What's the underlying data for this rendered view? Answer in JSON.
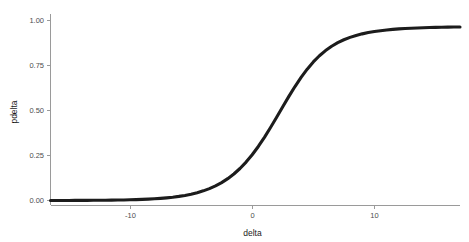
{
  "chart_data": {
    "type": "line",
    "title": "",
    "subtitle": "",
    "xlabel": "delta",
    "ylabel": "pdelta",
    "xlim": [
      -17.5,
      16.0
    ],
    "ylim": [
      -0.02,
      1.02
    ],
    "grid": false,
    "legend": null,
    "legend_position": "none",
    "annotations": [],
    "x_ticks": [
      -10,
      0,
      10
    ],
    "x_tick_labels": [
      "-10",
      "0",
      "10"
    ],
    "y_ticks": [
      0.0,
      0.25,
      0.5,
      0.75,
      1.0
    ],
    "y_tick_labels": [
      "0.00",
      "0.25",
      "0.50",
      "0.75",
      "1.00"
    ],
    "series": [
      {
        "name": "pdelta",
        "color": "#1c1c1c",
        "x": [
          -17.5,
          -17.0,
          -16.5,
          -16.0,
          -15.5,
          -15.0,
          -14.5,
          -14.0,
          -13.5,
          -13.0,
          -12.5,
          -12.0,
          -11.5,
          -11.0,
          -10.5,
          -10.0,
          -9.5,
          -9.0,
          -8.5,
          -8.0,
          -7.5,
          -7.0,
          -6.5,
          -6.0,
          -5.5,
          -5.0,
          -4.5,
          -4.0,
          -3.5,
          -3.0,
          -2.5,
          -2.0,
          -1.5,
          -1.0,
          -0.5,
          0.0,
          0.5,
          1.0,
          1.5,
          2.0,
          2.5,
          3.0,
          3.5,
          4.0,
          4.5,
          5.0,
          5.5,
          6.0,
          6.5,
          7.0,
          7.5,
          8.0,
          8.5,
          9.0,
          9.5,
          10.0,
          10.5,
          11.0,
          11.5,
          12.0,
          12.5,
          13.0,
          13.5,
          14.0,
          14.5,
          15.0,
          15.5,
          16.0
        ],
        "y": [
          0.0002,
          0.0003,
          0.0003,
          0.0004,
          0.0005,
          0.0007,
          0.0008,
          0.001,
          0.0013,
          0.0016,
          0.002,
          0.0025,
          0.0031,
          0.0039,
          0.0049,
          0.0061,
          0.0076,
          0.0095,
          0.0118,
          0.0147,
          0.0183,
          0.0228,
          0.0283,
          0.0351,
          0.0435,
          0.0537,
          0.0662,
          0.0813,
          0.0995,
          0.1213,
          0.1473,
          0.1779,
          0.2135,
          0.2543,
          0.3002,
          0.3508,
          0.4054,
          0.4626,
          0.5209,
          0.5783,
          0.6331,
          0.6839,
          0.7296,
          0.7697,
          0.804,
          0.8329,
          0.857,
          0.8768,
          0.893,
          0.9063,
          0.917,
          0.9258,
          0.9329,
          0.9387,
          0.9435,
          0.9474,
          0.9505,
          0.9532,
          0.9553,
          0.9571,
          0.9586,
          0.9599,
          0.9609,
          0.9618,
          0.9625,
          0.9631,
          0.9636,
          0.964
        ],
        "curve_model": "logistic",
        "midpoint": 1.32,
        "steepness": 0.46,
        "asymptote_low": 0.0,
        "asymptote_high": 1.0
      }
    ]
  },
  "axes": {
    "x_title": "delta",
    "y_title": "pdelta",
    "x_tick_labels": [
      "-10",
      "0",
      "10"
    ],
    "y_tick_labels": [
      "0.00",
      "0.25",
      "0.50",
      "0.75",
      "1.00"
    ]
  },
  "style": {
    "line_color": "#1c1c1c",
    "axis_color": "#9a9a9a",
    "tick_label_color": "#4d4d4d",
    "title_color": "#1a1a1a",
    "background": "#ffffff"
  }
}
